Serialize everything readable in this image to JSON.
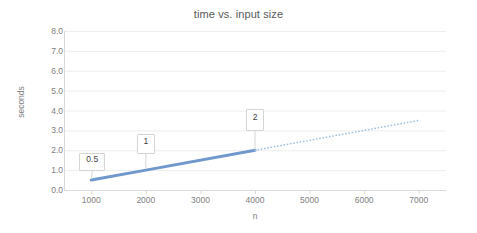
{
  "chart_data": {
    "type": "line",
    "title": "time vs. input size",
    "xlabel": "n",
    "ylabel": "seconds",
    "xlim": [
      500,
      7500
    ],
    "ylim": [
      0.0,
      8.0
    ],
    "grid": true,
    "legend": "none",
    "x_ticks": [
      "1000",
      "2000",
      "3000",
      "4000",
      "5000",
      "6000",
      "7000"
    ],
    "x_tick_values": [
      1000,
      2000,
      3000,
      4000,
      5000,
      6000,
      7000
    ],
    "y_ticks": [
      "0.0",
      "1.0",
      "2.0",
      "3.0",
      "4.0",
      "5.0",
      "6.0",
      "7.0",
      "8.0"
    ],
    "y_tick_values": [
      0,
      1,
      2,
      3,
      4,
      5,
      6,
      7,
      8
    ],
    "series": [
      {
        "name": "measured",
        "style": "solid",
        "color": "#6f98cd",
        "x": [
          1000,
          2000,
          4000
        ],
        "values": [
          0.5,
          1.0,
          2.0
        ],
        "point_labels": [
          "0.5",
          "1",
          "2"
        ]
      },
      {
        "name": "trendline",
        "style": "dotted",
        "color": "#9dc0e3",
        "x": [
          4000,
          7000
        ],
        "values": [
          2.0,
          3.5
        ],
        "point_labels": []
      }
    ],
    "annotations": [
      {
        "text": "0.5",
        "x": 1000,
        "y": 0.5
      },
      {
        "text": "1",
        "x": 2000,
        "y": 1.0
      },
      {
        "text": "2",
        "x": 4000,
        "y": 2.0
      }
    ]
  },
  "colors": {
    "title_text": "#595959",
    "tick_text": "#808080",
    "gridline": "#ededed",
    "axis_line": "#d9d9d9",
    "series_solid": "#6f98cd",
    "series_dotted": "#9dc0e3",
    "label_border": "#d4d4d4",
    "label_text": "#404040",
    "background": "#ffffff"
  }
}
